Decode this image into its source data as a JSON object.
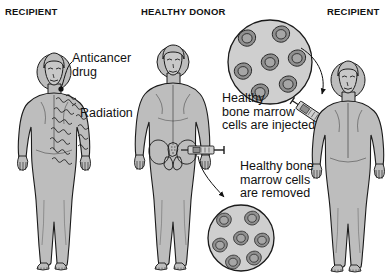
{
  "figure": {
    "background_color": "#ffffff",
    "body_fill_color": "#bdbdbd",
    "body_outline_color": "#1a1a1a",
    "cell_fill_color": "#8f8f8f",
    "cell_outline_color": "#1a1a1a",
    "dish_fill_color": "#cfcfcf",
    "text_color": "#111111"
  },
  "headers": {
    "left": "RECIPIENT",
    "middle": "HEALTHY DONOR",
    "right": "RECIPIENT"
  },
  "annotations": {
    "anticancer_drug": "Anticancer\ndrug",
    "radiation": "Radiation",
    "cells_injected": "Healthy\nbone marrow\ncells are injected",
    "cells_removed": "Healthy bone\nmarrow cells\nare removed"
  },
  "panels": [
    {
      "name": "recipient-treatment",
      "header": "RECIPIENT",
      "person": "female recipient receiving anticancer drug and radiation",
      "labels": [
        "Anticancer drug",
        "Radiation"
      ]
    },
    {
      "name": "healthy-donor",
      "header": "HEALTHY DONOR",
      "person": "male healthy donor with pelvis highlighted and syringe at hip",
      "labels": [
        "Healthy bone marrow cells are removed"
      ]
    },
    {
      "name": "recipient-transplant",
      "header": "RECIPIENT",
      "person": "female recipient receiving bone marrow injection in arm",
      "labels": [
        "Healthy bone marrow cells are injected"
      ]
    }
  ],
  "cell_dishes": [
    {
      "name": "injected-cells-dish",
      "position": "top-right",
      "cell_count": 7,
      "caption": "Healthy bone marrow cells are injected"
    },
    {
      "name": "removed-cells-dish",
      "position": "bottom-center",
      "cell_count": 7,
      "caption": "Healthy bone marrow cells are removed"
    }
  ],
  "syringes": [
    {
      "name": "donor-extraction-syringe",
      "location": "donor hip"
    },
    {
      "name": "recipient-injection-syringe",
      "location": "recipient arm"
    }
  ]
}
